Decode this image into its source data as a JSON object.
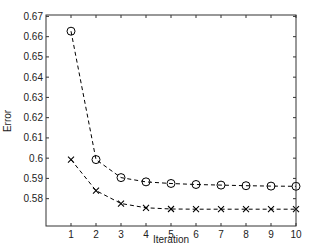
{
  "chart_data": {
    "type": "line",
    "title": "",
    "xlabel": "Iteration",
    "ylabel": "Error",
    "xlim": [
      0.0,
      10.0
    ],
    "ylim": [
      0.5665,
      0.6707
    ],
    "xticks": [
      1,
      2,
      3,
      4,
      5,
      6,
      7,
      8,
      9,
      10
    ],
    "yticks": [
      0.58,
      0.59,
      0.6,
      0.61,
      0.62,
      0.63,
      0.64,
      0.65,
      0.66,
      0.67
    ],
    "ytick_labels": [
      "0.58",
      "0.59",
      "0.6",
      "0.61",
      "0.62",
      "0.63",
      "0.64",
      "0.65",
      "0.66",
      "0.67"
    ],
    "grid": false,
    "legend": null,
    "x": [
      1,
      2,
      3,
      4,
      5,
      6,
      7,
      8,
      9,
      10
    ],
    "series": [
      {
        "name": "circle-series",
        "marker": "o",
        "linestyle": "dashed",
        "color": "#000000",
        "values": [
          0.6627,
          0.5993,
          0.5904,
          0.5883,
          0.5875,
          0.587,
          0.5867,
          0.5864,
          0.5862,
          0.5861
        ]
      },
      {
        "name": "cross-series",
        "marker": "x",
        "linestyle": "dashed",
        "color": "#000000",
        "values": [
          0.5993,
          0.584,
          0.5776,
          0.5755,
          0.5749,
          0.5748,
          0.5748,
          0.5748,
          0.5748,
          0.5748
        ]
      }
    ]
  }
}
